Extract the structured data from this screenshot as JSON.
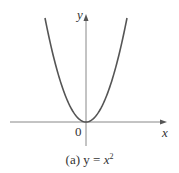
{
  "chart_data": {
    "type": "line",
    "caption_prefix": "(a) ",
    "caption_y": "y",
    "caption_eq": " = ",
    "caption_x": "x",
    "caption_exp": "2",
    "xlabel": "x",
    "ylabel": "y",
    "origin_label": "0",
    "function": "y = x^2",
    "series": [
      {
        "name": "y = x^2",
        "x": [
          -2,
          -1.5,
          -1,
          -0.5,
          0,
          0.5,
          1,
          1.5,
          2
        ],
        "values": [
          4,
          2.25,
          1,
          0.25,
          0,
          0.25,
          1,
          2.25,
          4
        ]
      }
    ],
    "grid": false,
    "curve_color": "#555555",
    "axis_color": "#777777"
  }
}
